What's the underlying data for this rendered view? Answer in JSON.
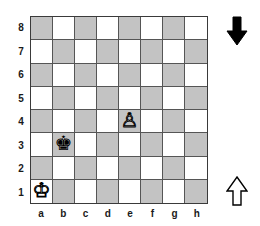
{
  "board": {
    "files": [
      "a",
      "b",
      "c",
      "d",
      "e",
      "f",
      "g",
      "h"
    ],
    "ranks": [
      "8",
      "7",
      "6",
      "5",
      "4",
      "3",
      "2",
      "1"
    ],
    "light_color": "#ffffff",
    "dark_color": "#c3c3c3",
    "border_color": "#3a3a3a",
    "pieces": [
      {
        "square": "a1",
        "piece": "white-king",
        "glyph": "♔",
        "color": "white",
        "name": "King"
      },
      {
        "square": "b3",
        "piece": "black-king",
        "glyph": "♚",
        "color": "black",
        "name": "King"
      },
      {
        "square": "e4",
        "piece": "white-pawn",
        "glyph": "♙",
        "color": "white",
        "name": "Pawn"
      }
    ]
  },
  "indicators": {
    "black_arrow": {
      "icon": "arrow-down-filled-icon",
      "direction": "down",
      "fill": "#000000",
      "side": "black"
    },
    "white_arrow": {
      "icon": "arrow-up-outline-icon",
      "direction": "up",
      "fill": "#ffffff",
      "stroke": "#000000",
      "side": "white"
    }
  }
}
